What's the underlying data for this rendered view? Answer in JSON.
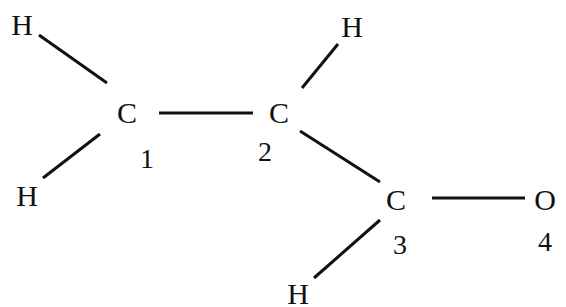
{
  "diagram": {
    "type": "structural-formula",
    "atoms": [
      {
        "id": "h_top_left",
        "symbol": "H",
        "x": 22,
        "y": 25
      },
      {
        "id": "c1",
        "symbol": "C",
        "x": 127,
        "y": 113,
        "number": "1",
        "nx": 147,
        "ny": 159
      },
      {
        "id": "c2",
        "symbol": "C",
        "x": 279,
        "y": 113,
        "number": "2",
        "nx": 265,
        "ny": 152
      },
      {
        "id": "h_top_right",
        "symbol": "H",
        "x": 352,
        "y": 27
      },
      {
        "id": "h_bottom_left",
        "symbol": "H",
        "x": 27,
        "y": 196
      },
      {
        "id": "c3",
        "symbol": "C",
        "x": 396,
        "y": 200,
        "number": "3",
        "nx": 400,
        "ny": 245
      },
      {
        "id": "o4",
        "symbol": "O",
        "x": 545,
        "y": 200,
        "number": "4",
        "nx": 545,
        "ny": 242
      },
      {
        "id": "h_bottom",
        "symbol": "H",
        "x": 298,
        "y": 294
      }
    ],
    "bonds": [
      {
        "from": "h_top_left",
        "to": "c1",
        "x1": 39,
        "y1": 35,
        "x2": 107,
        "y2": 83
      },
      {
        "from": "c1",
        "to": "c2",
        "x1": 159,
        "y1": 113,
        "x2": 253,
        "y2": 113
      },
      {
        "from": "c1",
        "to": "h_bottom_left",
        "x1": 100,
        "y1": 134,
        "x2": 43,
        "y2": 178
      },
      {
        "from": "c2",
        "to": "h_top_right",
        "x1": 302,
        "y1": 88,
        "x2": 338,
        "y2": 44
      },
      {
        "from": "c2",
        "to": "c3",
        "x1": 300,
        "y1": 131,
        "x2": 380,
        "y2": 182
      },
      {
        "from": "c3",
        "to": "o4",
        "x1": 432,
        "y1": 198,
        "x2": 525,
        "y2": 198
      },
      {
        "from": "c3",
        "to": "h_bottom",
        "x1": 380,
        "y1": 220,
        "x2": 314,
        "y2": 278
      }
    ]
  }
}
